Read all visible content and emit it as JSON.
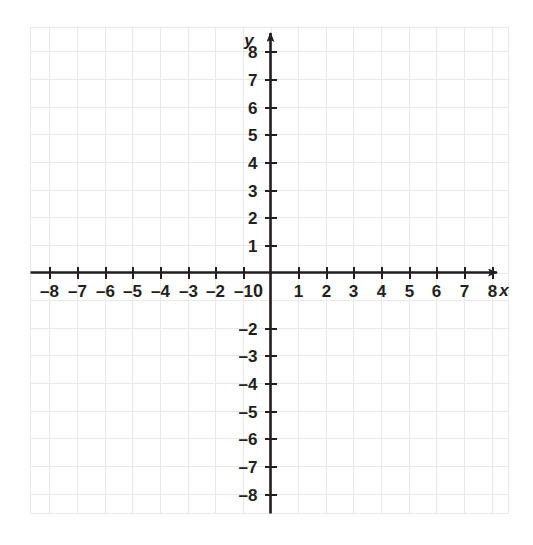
{
  "chart_data": {
    "type": "scatter",
    "title": "",
    "subtitle": "",
    "xlabel": "x",
    "ylabel": "y",
    "xlim": [
      -8,
      8
    ],
    "ylim": [
      -8,
      8
    ],
    "grid": true,
    "legend": null,
    "series": [],
    "x": [],
    "values": [],
    "annotations": [],
    "origin_label": "0",
    "x_tick_labels": [
      "-8",
      "-7",
      "-6",
      "-5",
      "-4",
      "-3",
      "-2",
      "-1",
      "1",
      "2",
      "3",
      "4",
      "5",
      "6",
      "7",
      "8"
    ],
    "x_tick_values": [
      -8,
      -7,
      -6,
      -5,
      -4,
      -3,
      -2,
      -1,
      1,
      2,
      3,
      4,
      5,
      6,
      7,
      8
    ],
    "y_tick_labels": [
      "8",
      "7",
      "6",
      "5",
      "4",
      "3",
      "2",
      "1",
      "-2",
      "-3",
      "-4",
      "-5",
      "-6",
      "-7",
      "-8"
    ],
    "y_tick_values": [
      8,
      7,
      6,
      5,
      4,
      3,
      2,
      1,
      -2,
      -3,
      -4,
      -5,
      -6,
      -7,
      -8
    ],
    "axis_arrows": [
      "x-positive",
      "y-positive"
    ],
    "minor_grid_step": 1,
    "colors": {
      "grid": "#e9e9e9",
      "axis": "#231f20",
      "label": "#231f20",
      "background": "#ffffff"
    }
  },
  "axes": {
    "x_axis_name": "x",
    "y_axis_name": "y",
    "origin": "0"
  },
  "icons": {
    "x_arrow": "arrow-right-icon",
    "y_arrow": "arrow-up-icon"
  }
}
